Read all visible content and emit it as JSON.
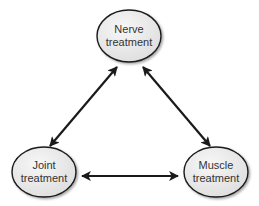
{
  "diagram": {
    "nodes": [
      {
        "id": "nerve",
        "line1": "Nerve",
        "line2": "treatment"
      },
      {
        "id": "joint",
        "line1": "Joint",
        "line2": "treatment"
      },
      {
        "id": "muscle",
        "line1": "Muscle",
        "line2": "treatment"
      }
    ],
    "edges": [
      {
        "from": "nerve",
        "to": "joint",
        "direction": "bidirectional"
      },
      {
        "from": "nerve",
        "to": "muscle",
        "direction": "bidirectional"
      },
      {
        "from": "joint",
        "to": "muscle",
        "direction": "bidirectional"
      }
    ],
    "colors": {
      "node_fill": "#ebebeb",
      "node_stroke": "#1a1a1a",
      "arrow": "#1a1a1a",
      "text": "#333333"
    }
  }
}
